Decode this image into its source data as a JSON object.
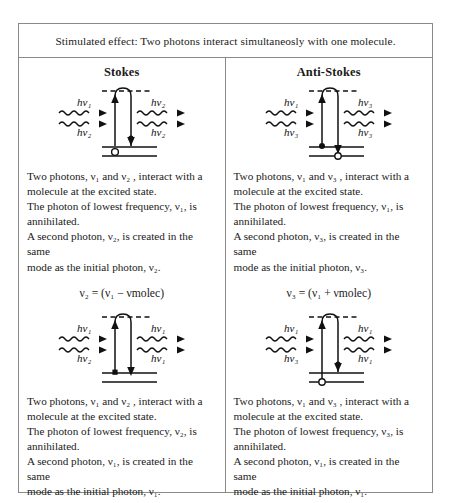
{
  "caption": "Stimulated effect: Two photons interact simultaneosly with one molecule.",
  "columns": [
    {
      "header": "Stokes",
      "blocks": [
        {
          "diagram": {
            "name": "stokes-upper-diagram",
            "left_top_label": "hν₁",
            "left_bottom_label": "hν₂",
            "right_top_label": "hν₂",
            "right_bottom_label": "hν₂",
            "start_state": "excited",
            "end_state": "ground"
          },
          "text_lines": [
            "Two photons, ν₁ and ν₂ , interact with a",
            "molecule at the excited state.",
            "The photon of lowest frequency, ν₁, is",
            "annihilated.",
            "A second photon, ν₂, is created in the same",
            "mode as the initial photon, ν₂."
          ],
          "equation": "ν₂ = (ν₁ − νmolec)"
        },
        {
          "diagram": {
            "name": "stokes-lower-diagram",
            "left_top_label": "hν₁",
            "left_bottom_label": "hν₂",
            "right_top_label": "hν₁",
            "right_bottom_label": "hν₁",
            "start_state": "ground",
            "end_state": "excited"
          },
          "text_lines": [
            "Two photons, ν₁ and ν₂ , interact with a",
            "molecule at the excited state.",
            "The photon of lowest frequency, ν₂, is",
            "annihilated.",
            "A second photon, ν₁, is created in the same",
            "mode as the initial photon, ν₁."
          ],
          "equation": ""
        }
      ]
    },
    {
      "header": "Anti-Stokes",
      "blocks": [
        {
          "diagram": {
            "name": "antistokes-upper-diagram",
            "left_top_label": "hν₁",
            "left_bottom_label": "hν₃",
            "right_top_label": "hν₃",
            "right_bottom_label": "hν₃",
            "start_state": "excited",
            "end_state": "ground"
          },
          "text_lines": [
            "Two photons, ν₁ and ν₃ , interact with a",
            "molecule at the excited state.",
            "The photon of lowest frequency, ν₁, is",
            "annihilated.",
            "A second photon, ν₃, is created in the same",
            "mode as the initial photon, ν₃."
          ],
          "equation": "ν₃ = (ν₁ + νmolec)"
        },
        {
          "diagram": {
            "name": "antistokes-lower-diagram",
            "left_top_label": "hν₁",
            "left_bottom_label": "hν₃",
            "right_top_label": "hν₁",
            "right_bottom_label": "hν₁",
            "start_state": "ground",
            "end_state": "excited"
          },
          "text_lines": [
            "Two photons, ν₁ and ν₃ , interact with a",
            "molecule at the excited state.",
            "The photon of lowest frequency, ν₃, is",
            "annihilated.",
            "A second photon, ν₁, is created in the same",
            "mode as the initial photon, ν₁."
          ],
          "equation": ""
        }
      ]
    }
  ],
  "colors": {
    "border": "#8a8a8a",
    "ink": "#1a1a1a",
    "background": "#ffffff"
  }
}
